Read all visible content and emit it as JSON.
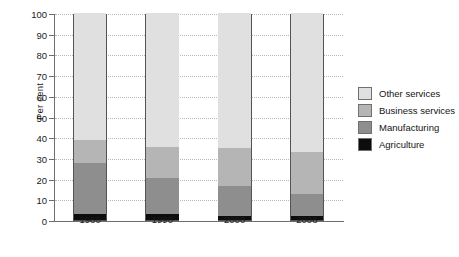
{
  "chart_data": {
    "type": "bar",
    "subtype": "stacked-percentage",
    "title": "",
    "xlabel": "",
    "ylabel": "Per cent",
    "categories": [
      "1980",
      "1990",
      "2000",
      "2008"
    ],
    "ylim": [
      0,
      100
    ],
    "yticks": [
      0,
      10,
      20,
      30,
      40,
      50,
      60,
      70,
      80,
      90,
      100
    ],
    "ytick_labels": [
      "0",
      "10",
      "20",
      "30",
      "40",
      "50",
      "60",
      "70",
      "80",
      "90",
      "100"
    ],
    "grid": "horizontal-dotted",
    "legend_position": "right",
    "series": [
      {
        "name": "Agriculture",
        "color": "#0d0d0d",
        "values": [
          2.7,
          2.7,
          2.0,
          1.8
        ]
      },
      {
        "name": "Manufacturing",
        "color": "#8e8e8e",
        "values": [
          24.8,
          17.6,
          14.5,
          10.7
        ]
      },
      {
        "name": "Business services",
        "color": "#b5b5b5",
        "values": [
          11.0,
          15.2,
          18.5,
          20.5
        ]
      },
      {
        "name": "Other services",
        "color": "#e0e0e0",
        "values": [
          61.5,
          64.5,
          65.0,
          67.0
        ]
      }
    ],
    "stack_tops": {
      "1980": {
        "Agriculture": 2.7,
        "Manufacturing": 27.5,
        "Business services": 38.5,
        "Other services": 100
      },
      "1990": {
        "Agriculture": 2.7,
        "Manufacturing": 20.3,
        "Business services": 35.5,
        "Other services": 100
      },
      "2000": {
        "Agriculture": 2.0,
        "Manufacturing": 16.5,
        "Business services": 35.0,
        "Other services": 100
      },
      "2008": {
        "Agriculture": 1.8,
        "Manufacturing": 12.5,
        "Business services": 33.0,
        "Other services": 100
      }
    },
    "legend": [
      {
        "label": "Other services",
        "color": "#e0e0e0"
      },
      {
        "label": "Business services",
        "color": "#b5b5b5"
      },
      {
        "label": "Manufacturing",
        "color": "#8e8e8e"
      },
      {
        "label": "Agriculture",
        "color": "#0d0d0d"
      }
    ]
  }
}
